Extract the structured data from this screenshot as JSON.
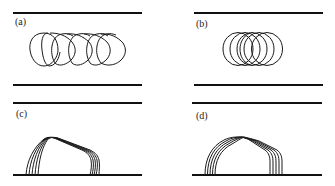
{
  "figure": {
    "panels": [
      {
        "id": "a",
        "label": "(a)",
        "walls": [
          {
            "x1": 13,
            "x2": 142,
            "y": 13
          },
          {
            "x1": 13,
            "x2": 142,
            "y": 85
          }
        ],
        "shape": "closed-loops",
        "loop_count": 4,
        "loop_spacing_px": 17
      },
      {
        "id": "b",
        "label": "(b)",
        "walls": [
          {
            "x1": 194,
            "x2": 323,
            "y": 13
          },
          {
            "x1": 194,
            "x2": 323,
            "y": 85
          }
        ],
        "shape": "closed-loops",
        "loop_count": 5,
        "loop_spacing_px": 7
      },
      {
        "id": "c",
        "label": "(c)",
        "walls": [
          {
            "x1": 13,
            "x2": 142,
            "y": 103
          },
          {
            "x1": 13,
            "x2": 142,
            "y": 175
          }
        ],
        "shape": "wall-attached-arches",
        "arch_count": 5
      },
      {
        "id": "d",
        "label": "(d)",
        "walls": [
          {
            "x1": 192,
            "x2": 322,
            "y": 103
          },
          {
            "x1": 192,
            "x2": 322,
            "y": 175
          }
        ],
        "shape": "wall-attached-arches",
        "arch_count": 5
      }
    ],
    "colors": {
      "ink": "#111111",
      "background": "#ffffff"
    }
  }
}
